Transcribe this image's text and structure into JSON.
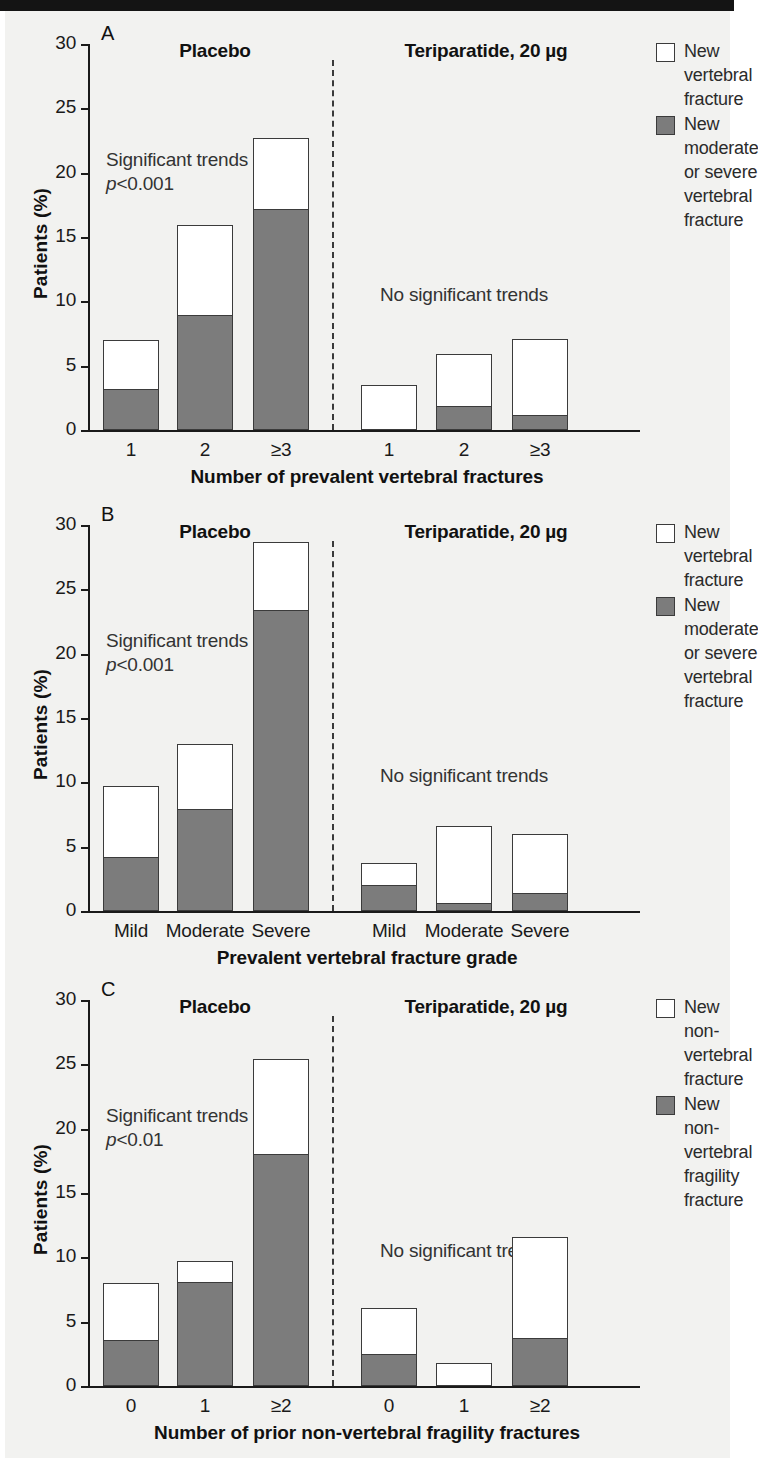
{
  "figure": {
    "background_color": "#f2f2f0",
    "bar_gray_color": "#7c7c7c",
    "bar_white_color": "#ffffff",
    "outline_color": "#3b3b3b"
  },
  "panels": [
    {
      "letter": "A",
      "group_left_title": "Placebo",
      "group_right_title": "Teriparatide, 20 µg",
      "annotation_left_line1": "Significant trends",
      "annotation_left_line2_italic": "p",
      "annotation_left_line2_rest": "<0.001",
      "annotation_right": "No significant trends",
      "xlabel": "Number of prevalent vertebral fractures",
      "ylabel": "Patients (%)",
      "legend": [
        {
          "swatch": "white",
          "label": "New\nvertebral\nfracture"
        },
        {
          "swatch": "gray",
          "label": "New\nmoderate\nor severe\nvertebral\nfracture"
        }
      ]
    },
    {
      "letter": "B",
      "group_left_title": "Placebo",
      "group_right_title": "Teriparatide, 20 µg",
      "annotation_left_line1": "Significant trends",
      "annotation_left_line2_italic": "p",
      "annotation_left_line2_rest": "<0.001",
      "annotation_right": "No significant trends",
      "xlabel": "Prevalent vertebral fracture grade",
      "ylabel": "Patients (%)",
      "legend": [
        {
          "swatch": "white",
          "label": "New\nvertebral\nfracture"
        },
        {
          "swatch": "gray",
          "label": "New\nmoderate\nor severe\nvertebral\nfracture"
        }
      ]
    },
    {
      "letter": "C",
      "group_left_title": "Placebo",
      "group_right_title": "Teriparatide, 20 µg",
      "annotation_left_line1": "Significant trends",
      "annotation_left_line2_italic": "p",
      "annotation_left_line2_rest": "<0.01",
      "annotation_right": "No significant trends",
      "xlabel": "Number of prior non-vertebral fragility fractures",
      "ylabel": "Patients (%)",
      "legend": [
        {
          "swatch": "white",
          "label": "New\nnon-vertebral\nfracture"
        },
        {
          "swatch": "gray",
          "label": "New\nnon-vertebral\nfragility\nfracture"
        }
      ]
    }
  ],
  "chart_data": [
    {
      "type": "bar",
      "panel": "A",
      "title": "",
      "xlabel": "Number of prevalent vertebral fractures",
      "ylabel": "Patients (%)",
      "ylim": [
        0,
        30
      ],
      "yticks": [
        0,
        5,
        10,
        15,
        20,
        25,
        30
      ],
      "ytick_labels": [
        "0",
        "5",
        "10",
        "15",
        "20",
        "25",
        "30"
      ],
      "grid": false,
      "legend_position": "right",
      "stacked": true,
      "groups": [
        "Placebo",
        "Teriparatide, 20 µg"
      ],
      "categories": [
        "1",
        "2",
        "≥3",
        "1",
        "2",
        "≥3"
      ],
      "categories_by_group": {
        "Placebo": [
          "1",
          "2",
          "≥3"
        ],
        "Teriparatide, 20 µg": [
          "1",
          "2",
          "≥3"
        ]
      },
      "series": [
        {
          "name": "New moderate or severe vertebral fracture",
          "color": "#7c7c7c",
          "values": [
            3.2,
            8.9,
            17.2,
            0.0,
            1.9,
            1.2
          ]
        },
        {
          "name": "New vertebral fracture (total height)",
          "color": "#ffffff",
          "values": [
            7.0,
            15.9,
            22.7,
            3.5,
            5.9,
            7.1
          ]
        }
      ],
      "annotations": [
        "Significant trends p<0.001",
        "No significant trends"
      ]
    },
    {
      "type": "bar",
      "panel": "B",
      "title": "",
      "xlabel": "Prevalent vertebral fracture grade",
      "ylabel": "Patients (%)",
      "ylim": [
        0,
        30
      ],
      "yticks": [
        0,
        5,
        10,
        15,
        20,
        25,
        30
      ],
      "ytick_labels": [
        "0",
        "5",
        "10",
        "15",
        "20",
        "25",
        "30"
      ],
      "grid": false,
      "legend_position": "right",
      "stacked": true,
      "groups": [
        "Placebo",
        "Teriparatide, 20 µg"
      ],
      "categories": [
        "Mild",
        "Moderate",
        "Severe",
        "Mild",
        "Moderate",
        "Severe"
      ],
      "categories_by_group": {
        "Placebo": [
          "Mild",
          "Moderate",
          "Severe"
        ],
        "Teriparatide, 20 µg": [
          "Mild",
          "Moderate",
          "Severe"
        ]
      },
      "series": [
        {
          "name": "New moderate or severe vertebral fracture",
          "color": "#7c7c7c",
          "values": [
            4.2,
            7.9,
            23.4,
            2.0,
            0.6,
            1.4
          ]
        },
        {
          "name": "New vertebral fracture (total height)",
          "color": "#ffffff",
          "values": [
            9.7,
            13.0,
            28.7,
            3.7,
            6.6,
            6.0
          ]
        }
      ],
      "annotations": [
        "Significant trends p<0.001",
        "No significant trends"
      ]
    },
    {
      "type": "bar",
      "panel": "C",
      "title": "",
      "xlabel": "Number of prior non-vertebral fragility fractures",
      "ylabel": "Patients (%)",
      "ylim": [
        0,
        30
      ],
      "yticks": [
        0,
        5,
        10,
        15,
        20,
        25,
        30
      ],
      "ytick_labels": [
        "0",
        "5",
        "10",
        "15",
        "20",
        "25",
        "30"
      ],
      "grid": false,
      "legend_position": "right",
      "stacked": true,
      "groups": [
        "Placebo",
        "Teriparatide, 20 µg"
      ],
      "categories": [
        "0",
        "1",
        "≥2",
        "0",
        "1",
        "≥2"
      ],
      "categories_by_group": {
        "Placebo": [
          "0",
          "1",
          "≥2"
        ],
        "Teriparatide, 20 µg": [
          "0",
          "1",
          "≥2"
        ]
      },
      "series": [
        {
          "name": "New non-vertebral fragility fracture",
          "color": "#7c7c7c",
          "values": [
            3.6,
            8.1,
            18.0,
            2.5,
            0.0,
            3.7
          ]
        },
        {
          "name": "New non-vertebral fracture (total height)",
          "color": "#ffffff",
          "values": [
            8.0,
            9.7,
            25.4,
            6.1,
            1.8,
            11.6
          ]
        }
      ],
      "annotations": [
        "Significant trends p<0.01",
        "No significant trends"
      ]
    }
  ]
}
